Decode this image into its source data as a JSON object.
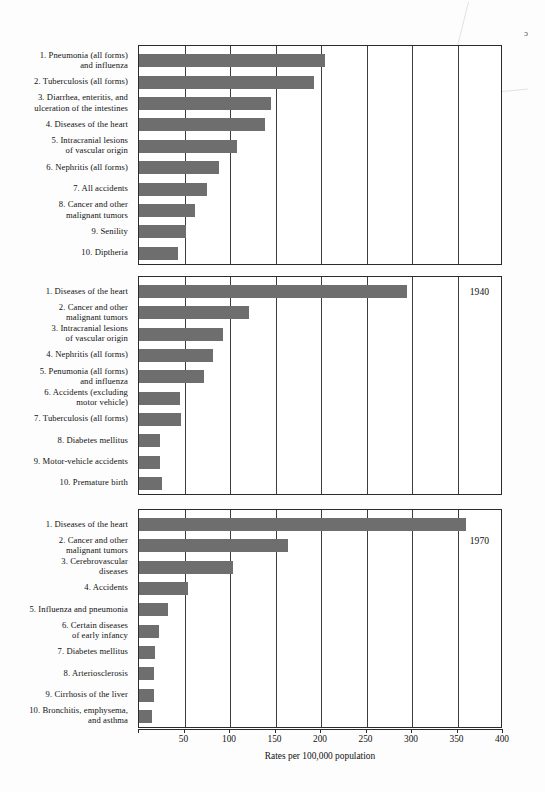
{
  "axis": {
    "title": "Rates per 100,000 population",
    "ticks": [
      0,
      50,
      100,
      150,
      200,
      250,
      300,
      350,
      400
    ],
    "tick_labels": [
      "",
      "50",
      "100",
      "150",
      "200",
      "250",
      "300",
      "350",
      "400"
    ],
    "min": 0,
    "max": 400
  },
  "colors": {
    "bar": "#6e6e6e",
    "frame": "#2b2b2b",
    "grid": "#3d3d3d",
    "text": "#111111"
  },
  "corner_mark": "ɔ",
  "chart_data": [
    {
      "type": "bar",
      "orientation": "horizontal",
      "title": "",
      "year": "",
      "xlabel": "Rates per 100,000 population",
      "ylabel": "",
      "xlim": [
        0,
        400
      ],
      "grid": true,
      "legend": "none",
      "categories": [
        "1.  Pneumonia (all forms)\nand influenza",
        "2.  Tuberculosis (all forms)",
        "3.  Diarrhea, enteritis, and\nulceration of the intestines",
        "4.  Diseases of the heart",
        "5.  Intracranial lesions\nof vascular origin",
        "6.  Nephritis (all forms)",
        "7.  All accidents",
        "8.  Cancer and other\nmalignant tumors",
        "9.  Senility",
        "10.  Diptheria"
      ],
      "values": [
        204,
        192,
        145,
        139,
        108,
        88,
        75,
        62,
        52,
        43
      ]
    },
    {
      "type": "bar",
      "orientation": "horizontal",
      "title": "",
      "year": "1940",
      "xlabel": "Rates per 100,000 population",
      "ylabel": "",
      "xlim": [
        0,
        400
      ],
      "grid": true,
      "legend": "none",
      "categories": [
        "1.  Diseases of the heart",
        "2.  Cancer and other\nmalignant tumors",
        "3.  Intracranial lesions\nof vascular origin",
        "4.  Nephritis (all forms)",
        "5.  Penumonia (all forms)\nand influenza",
        "6.  Accidents (excluding\nmotor vehicle)",
        "7.  Tuberculosis (all forms)",
        "8.  Diabetes mellitus",
        "9.  Motor-vehicle accidents",
        "10.  Premature birth"
      ],
      "values": [
        294,
        121,
        92,
        81,
        71,
        45,
        46,
        23,
        23,
        25
      ]
    },
    {
      "type": "bar",
      "orientation": "horizontal",
      "title": "",
      "year": "1970",
      "xlabel": "Rates per 100,000 population",
      "ylabel": "",
      "xlim": [
        0,
        400
      ],
      "grid": true,
      "legend": "none",
      "categories": [
        "1.  Diseases of the heart",
        "2.  Cancer and other\nmalignant tumors",
        "3.  Cerebrovascular\ndiseases",
        "4.  Accidents",
        "5.  Influenza and pneumonia",
        "6.  Certain diseases\nof early infancy",
        "7.  Diabetes mellitus",
        "8.  Arteriosclerosis",
        "9.  Cirrhosis of the liver",
        "10.  Bronchitis, emphysema,\nand asthma"
      ],
      "values": [
        359,
        164,
        103,
        54,
        32,
        22,
        18,
        16,
        16,
        14
      ]
    }
  ]
}
